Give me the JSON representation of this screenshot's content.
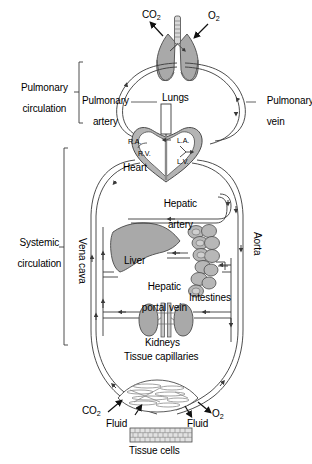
{
  "figure": {
    "background_color": "#ffffff",
    "line_color": "#3a3a3a",
    "organ_fill_color": "#a9a9a9",
    "organ_stroke_color": "#4a4a4a",
    "text_color": "#000000"
  },
  "brackets": {
    "pulmonary": {
      "label_line1": "Pulmonary",
      "label_line2": "circulation"
    },
    "systemic": {
      "label_line1": "Systemic",
      "label_line2": "circulation"
    }
  },
  "vessels": {
    "pulmonary_artery_line1": "Pulmonary",
    "pulmonary_artery_line2": "artery",
    "pulmonary_vein_line1": "Pulmonary",
    "pulmonary_vein_line2": "vein",
    "vena_cava": "Vena cava",
    "aorta": "Aorta",
    "hepatic_artery_line1": "Hepatic",
    "hepatic_artery_line2": "artery",
    "hepatic_portal_vein_line1": "Hepatic",
    "hepatic_portal_vein_line2": "portal vein"
  },
  "organs": {
    "lungs": "Lungs",
    "heart": "Heart",
    "liver": "Liver",
    "intestines": "Intestines",
    "kidneys": "Kidneys",
    "tissue_capillaries": "Tissue capillaries",
    "tissue_cells": "Tissue cells"
  },
  "heart_chambers": {
    "right_atrium": "R.A.",
    "right_ventricle": "R.V.",
    "left_atrium": "L.A.",
    "left_ventricle": "L.V."
  },
  "gas_exchange": {
    "lung_co2_main": "CO",
    "lung_co2_sub": "2",
    "lung_o2_main": "O",
    "lung_o2_sub": "2",
    "tissue_co2_main": "CO",
    "tissue_co2_sub": "2",
    "tissue_o2_main": "O",
    "tissue_o2_sub": "2",
    "fluid_left": "Fluid",
    "fluid_right": "Fluid"
  }
}
